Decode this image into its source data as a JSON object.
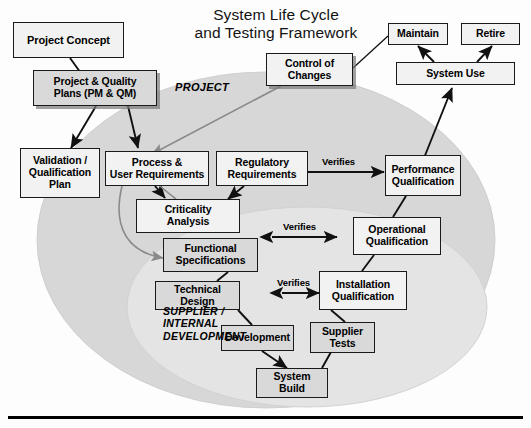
{
  "title": {
    "line1": "System Life Cycle",
    "line2": "and Testing Framework",
    "text": "System Life Cycle\nand Testing Framework"
  },
  "zones": [
    {
      "name": "project-zone",
      "label": "PROJECT"
    },
    {
      "name": "supplier-zone",
      "label": "SUPPLIER /\nINTERNAL\nDEVELOPMENT"
    }
  ],
  "nodes": [
    {
      "id": "project-concept",
      "label": "Project Concept"
    },
    {
      "id": "project-quality-plans",
      "label": "Project & Quality\nPlans (PM & QM)"
    },
    {
      "id": "validation-qualification-plan",
      "label": "Validation /\nQualification\nPlan"
    },
    {
      "id": "process-user-requirements",
      "label": "Process &\nUser Requirements"
    },
    {
      "id": "regulatory-requirements",
      "label": "Regulatory\nRequirements"
    },
    {
      "id": "criticality-analysis",
      "label": "Criticality\nAnalysis"
    },
    {
      "id": "functional-specifications",
      "label": "Functional\nSpecifications"
    },
    {
      "id": "technical-design",
      "label": "Technical Design"
    },
    {
      "id": "development",
      "label": "Development"
    },
    {
      "id": "supplier-tests",
      "label": "Supplier\nTests"
    },
    {
      "id": "system-build",
      "label": "System\nBuild"
    },
    {
      "id": "installation-qualification",
      "label": "Installation\nQualification"
    },
    {
      "id": "operational-qualification",
      "label": "Operational\nQualification"
    },
    {
      "id": "performance-qualification",
      "label": "Performance\nQualification"
    },
    {
      "id": "control-of-changes",
      "label": "Control of\nChanges"
    },
    {
      "id": "system-use",
      "label": "System Use"
    },
    {
      "id": "maintain",
      "label": "Maintain"
    },
    {
      "id": "retire",
      "label": "Retire"
    }
  ],
  "verifies": [
    {
      "id": "verifies-performance",
      "label": "Verifies"
    },
    {
      "id": "verifies-operational",
      "label": "Verifies"
    },
    {
      "id": "verifies-installation",
      "label": "Verifies"
    }
  ],
  "colors": {
    "page_background": "#fdfdfd",
    "outer_zone_fill": "#d7d7d7",
    "inner_zone_fill": "#e2e2e2",
    "box_light": "#f2f2f2",
    "box_mid": "#d9d9d9",
    "box_dark": "#c9c9c9",
    "outline": "#1a1a1a",
    "connector": "#111111",
    "soft_connector": "#8a8a8a",
    "baseline_rule": "#000000"
  }
}
